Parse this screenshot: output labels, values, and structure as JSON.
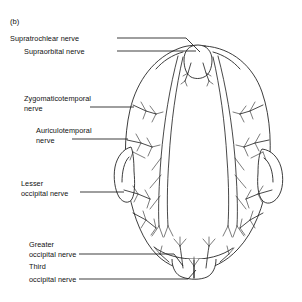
{
  "figure": {
    "panel_label": "(b)",
    "view": "superior view of head",
    "background_color": "#ffffff",
    "line_color": "#1a1a1a"
  },
  "labels": [
    {
      "id": "supratrochlear",
      "name": "supratrochlear-nerve",
      "line1": "Supratrochlear nerve",
      "line2": ""
    },
    {
      "id": "supraorbital",
      "name": "supraorbital-nerve",
      "line1": "Supraorbital nerve",
      "line2": ""
    },
    {
      "id": "zygomaticotemporal",
      "name": "zygomaticotemporal-nerve",
      "line1": "Zygomaticotemporal",
      "line2": "nerve"
    },
    {
      "id": "auriculotemporal",
      "name": "auriculotemporal-nerve",
      "line1": "Auriculotemporal",
      "line2": "nerve"
    },
    {
      "id": "lesser_occipital",
      "name": "lesser-occipital-nerve",
      "line1": "Lesser",
      "line2": "occipital nerve"
    },
    {
      "id": "greater_occipital",
      "name": "greater-occipital-nerve",
      "line1": "Greater",
      "line2": "occipital nerve"
    },
    {
      "id": "third_occipital",
      "name": "third-occipital-nerve",
      "line1": "Third",
      "line2": "occipital nerve"
    }
  ]
}
